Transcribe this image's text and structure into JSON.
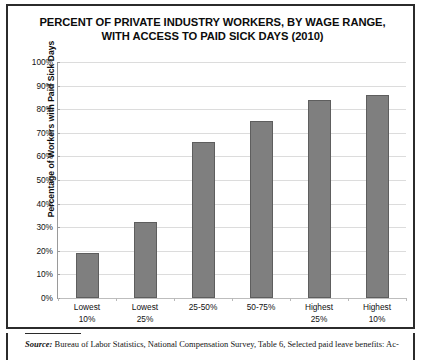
{
  "title": {
    "line1": "PERCENT OF PRIVATE INDUSTRY WORKERS, BY WAGE RANGE,",
    "line2": "WITH ACCESS TO PAID SICK DAYS (2010)"
  },
  "footnote": {
    "source_label": "Source:",
    "text": " Bureau of Labor Statistics, National Compensation Survey, Table 6, Selected paid leave benefits: Ac-"
  },
  "colors": {
    "bar_fill": "#7f7f7f",
    "bar_border": "#5e5e5e",
    "gridline": "#dcdcdc",
    "axis": "#9a9a9a",
    "frame": "#2b2b2b",
    "text": "#111111"
  },
  "chart_data": {
    "type": "bar",
    "title": "PERCENT OF PRIVATE INDUSTRY WORKERS, BY WAGE RANGE, WITH ACCESS TO PAID SICK DAYS (2010)",
    "xlabel": "",
    "ylabel": "Percentage of Workers with Paid Sick Days",
    "ylim": [
      0,
      100
    ],
    "ytick_labels": [
      "0%",
      "10%",
      "20%",
      "30%",
      "40%",
      "50%",
      "60%",
      "70%",
      "80%",
      "90%",
      "100%"
    ],
    "ytick_values": [
      0,
      10,
      20,
      30,
      40,
      50,
      60,
      70,
      80,
      90,
      100
    ],
    "grid": true,
    "legend": false,
    "categories": [
      {
        "line1": "Lowest",
        "line2": "10%"
      },
      {
        "line1": "Lowest",
        "line2": "25%"
      },
      {
        "line1": "25-50%",
        "line2": ""
      },
      {
        "line1": "50-75%",
        "line2": ""
      },
      {
        "line1": "Highest",
        "line2": "25%"
      },
      {
        "line1": "Highest",
        "line2": "10%"
      }
    ],
    "values": [
      19,
      32,
      66,
      75,
      84,
      86
    ]
  }
}
